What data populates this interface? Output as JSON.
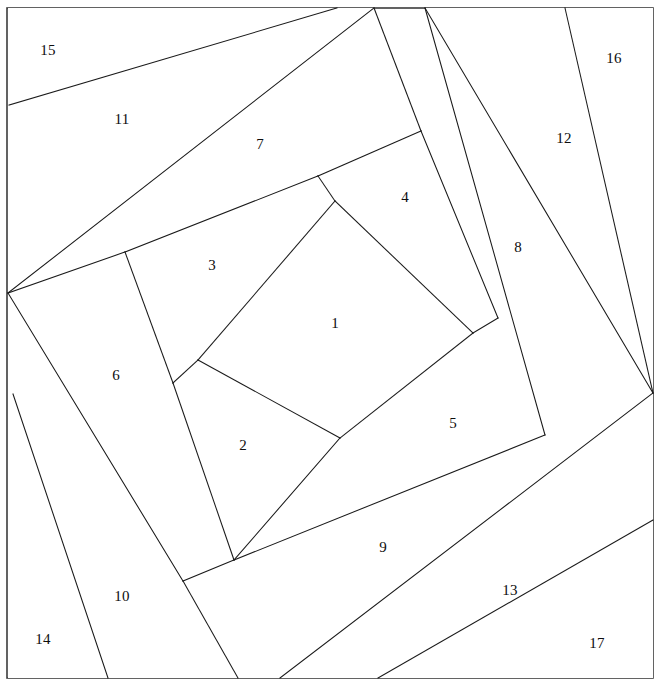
{
  "figure": {
    "width": 661,
    "height": 687,
    "background_color": "#ffffff",
    "line_color": "#1a1a1a",
    "frame_color": "#3c3c3c",
    "label_color": "#0d0d0d"
  },
  "frame": {
    "name": "outer-square-border",
    "x": 7,
    "y": 8,
    "width": 646,
    "height": 670
  },
  "chart_data": {
    "type": "diagram",
    "region_count": 17,
    "regions": [
      {
        "id": 1,
        "label": "1",
        "label_x": 335,
        "label_y": 325,
        "points": "335,201 473,333 340,438 198,360"
      },
      {
        "id": 2,
        "label": "2",
        "label_x": 243,
        "label_y": 447,
        "points": "198,360 340,438 234,560 173,383"
      },
      {
        "id": 3,
        "label": "3",
        "label_x": 212,
        "label_y": 267,
        "points": "125,252 318,176 335,201 198,360 173,383"
      },
      {
        "id": 4,
        "label": "4",
        "label_x": 405,
        "label_y": 199,
        "points": "318,176 421,131 498,318 473,333 335,201"
      },
      {
        "id": 5,
        "label": "5",
        "label_x": 453,
        "label_y": 425,
        "points": "473,333 498,318 545,435 297,540 234,560 340,438"
      },
      {
        "id": 6,
        "label": "6",
        "label_x": 116,
        "label_y": 377,
        "points": "8,293 125,252 173,383 234,560 183,581"
      },
      {
        "id": 7,
        "label": "7",
        "label_x": 260,
        "label_y": 146,
        "points": "374,8 421,131 318,176 125,252 8,293"
      },
      {
        "id": 8,
        "label": "8",
        "label_x": 518,
        "label_y": 249,
        "points": "425,8 545,435 297,540 238,678 280,678 653,393 653,393"
      },
      {
        "id": 9,
        "label": "9",
        "label_x": 383,
        "label_y": 549,
        "points": "183,581 234,560 297,540 653,393 280,678 238,678"
      },
      {
        "id": 10,
        "label": "10",
        "label_x": 122,
        "label_y": 598,
        "points": "13,394 183,581 238,678 108,678"
      },
      {
        "id": 11,
        "label": "11",
        "label_x": 122,
        "label_y": 121,
        "points": "9,105 337,8 374,8 8,293"
      },
      {
        "id": 12,
        "label": "12",
        "label_x": 564,
        "label_y": 140,
        "points": "565,8 425,8 653,393 653,393"
      },
      {
        "id": 13,
        "label": "13",
        "label_x": 510,
        "label_y": 592,
        "points": "280,678 653,393 653,520 378,678"
      },
      {
        "id": 14,
        "label": "14",
        "label_x": 43,
        "label_y": 641,
        "points": "8,394 108,678 8,678"
      },
      {
        "id": 15,
        "label": "15",
        "label_x": 48,
        "label_y": 52,
        "points": "8,8 337,8 9,105"
      },
      {
        "id": 16,
        "label": "16",
        "label_x": 614,
        "label_y": 60,
        "points": "565,8 653,8 653,393"
      },
      {
        "id": 17,
        "label": "17",
        "label_x": 597,
        "label_y": 645,
        "points": "378,678 653,520 653,678"
      }
    ],
    "edges": [
      {
        "name": "edge-1-2",
        "x1": 198,
        "y1": 360,
        "x2": 340,
        "y2": 438
      },
      {
        "name": "edge-1-3",
        "x1": 335,
        "y1": 201,
        "x2": 198,
        "y2": 360
      },
      {
        "name": "edge-1-4",
        "x1": 335,
        "y1": 201,
        "x2": 473,
        "y2": 333
      },
      {
        "name": "edge-1-5",
        "x1": 473,
        "y1": 333,
        "x2": 340,
        "y2": 438
      },
      {
        "name": "edge-2-6",
        "x1": 173,
        "y1": 383,
        "x2": 234,
        "y2": 560
      },
      {
        "name": "edge-2-5",
        "x1": 340,
        "y1": 438,
        "x2": 234,
        "y2": 560
      },
      {
        "name": "edge-3-2",
        "x1": 173,
        "y1": 383,
        "x2": 198,
        "y2": 360
      },
      {
        "name": "edge-3-6",
        "x1": 125,
        "y1": 252,
        "x2": 173,
        "y2": 383
      },
      {
        "name": "edge-3-7",
        "x1": 125,
        "y1": 252,
        "x2": 318,
        "y2": 176
      },
      {
        "name": "edge-4-3",
        "x1": 318,
        "y1": 176,
        "x2": 335,
        "y2": 201
      },
      {
        "name": "edge-4-7",
        "x1": 318,
        "y1": 176,
        "x2": 421,
        "y2": 131
      },
      {
        "name": "edge-4-8",
        "x1": 421,
        "y1": 131,
        "x2": 498,
        "y2": 318
      },
      {
        "name": "edge-5-8",
        "x1": 473,
        "y1": 333,
        "x2": 498,
        "y2": 318
      },
      {
        "name": "edge-5-9",
        "x1": 234,
        "y1": 560,
        "x2": 545,
        "y2": 435
      },
      {
        "name": "edge-6-11",
        "x1": 8,
        "y1": 293,
        "x2": 125,
        "y2": 252
      },
      {
        "name": "edge-6-10",
        "x1": 8,
        "y1": 293,
        "x2": 183,
        "y2": 581
      },
      {
        "name": "edge-6-9",
        "x1": 183,
        "y1": 581,
        "x2": 234,
        "y2": 560
      },
      {
        "name": "edge-7-11",
        "x1": 8,
        "y1": 293,
        "x2": 374,
        "y2": 8
      },
      {
        "name": "edge-7-12",
        "x1": 421,
        "y1": 131,
        "x2": 374,
        "y2": 8
      },
      {
        "name": "edge-8-12",
        "x1": 425,
        "y1": 8,
        "x2": 653,
        "y2": 393
      },
      {
        "name": "edge-8-4",
        "x1": 425,
        "y1": 8,
        "x2": 545,
        "y2": 435
      },
      {
        "name": "edge-9-10",
        "x1": 183,
        "y1": 581,
        "x2": 238,
        "y2": 678
      },
      {
        "name": "edge-9-13",
        "x1": 280,
        "y1": 678,
        "x2": 653,
        "y2": 393
      },
      {
        "name": "edge-10-14",
        "x1": 13,
        "y1": 394,
        "x2": 108,
        "y2": 678
      },
      {
        "name": "edge-11-15",
        "x1": 9,
        "y1": 105,
        "x2": 337,
        "y2": 8
      },
      {
        "name": "edge-12-16",
        "x1": 565,
        "y1": 8,
        "x2": 653,
        "y2": 393
      },
      {
        "name": "edge-13-17",
        "x1": 378,
        "y1": 678,
        "x2": 653,
        "y2": 520
      }
    ]
  }
}
